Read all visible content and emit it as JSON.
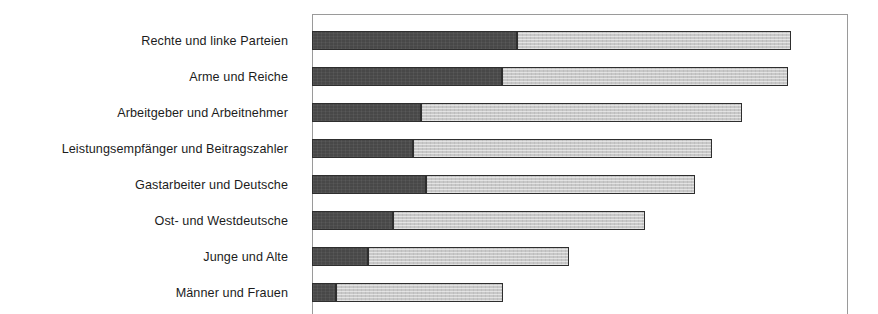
{
  "chart_data": {
    "type": "bar",
    "orientation": "horizontal",
    "stacked": true,
    "title": "",
    "subtitle": "",
    "xlabel": "",
    "ylabel": "",
    "grid": false,
    "legend_position": "none",
    "xlim": [
      0,
      100
    ],
    "xticks": [],
    "xticklabels": [],
    "categories": [
      "Rechte und linke Parteien",
      "Arme und Reiche",
      "Arbeitgeber und Arbeitnehmer",
      "Leistungsempfänger und Beitragszahler",
      "Gastarbeiter und Deutsche",
      "Ost- und Westdeutsche",
      "Junge und Alte",
      "Männer und Frauen"
    ],
    "series": [
      {
        "name": "dunkles Segment",
        "color": "#484848",
        "values": [
          38.2,
          35.4,
          20.3,
          18.8,
          21.1,
          14.9,
          10.3,
          4.3
        ]
      },
      {
        "name": "helles Segment",
        "color": "#c8c8c8",
        "values": [
          51.3,
          53.5,
          60.1,
          56.0,
          50.4,
          47.2,
          37.6,
          31.3
        ]
      }
    ],
    "totals": [
      89.5,
      88.9,
      80.4,
      74.8,
      71.5,
      62.1,
      47.9,
      35.6
    ],
    "colors": {
      "segment_dark": "#484848",
      "segment_light": "#c8c8c8",
      "bar_border": "#2e2e2e",
      "plot_border": "#9a9a9a",
      "label_text": "#1c1c1c",
      "background": "#ffffff"
    }
  }
}
